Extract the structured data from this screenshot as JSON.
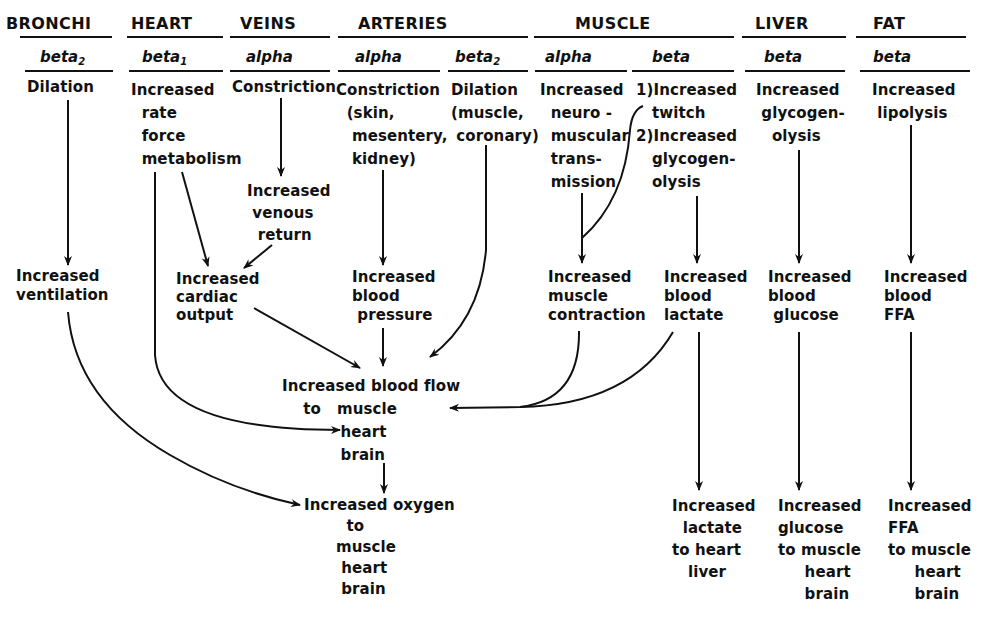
{
  "headers": [
    {
      "id": "bronchi",
      "label": "BRONCHI"
    },
    {
      "id": "heart",
      "label": "HEART"
    },
    {
      "id": "veins",
      "label": "VEINS"
    },
    {
      "id": "arteries",
      "label": "ARTERIES"
    },
    {
      "id": "muscle",
      "label": "MUSCLE"
    },
    {
      "id": "liver",
      "label": "LIVER"
    },
    {
      "id": "fat",
      "label": "FAT"
    }
  ],
  "receptors": [
    {
      "col": "bronchi",
      "label": "beta",
      "sub": "2"
    },
    {
      "col": "heart",
      "label": "beta",
      "sub": "1"
    },
    {
      "col": "veins",
      "label": "alpha",
      "sub": ""
    },
    {
      "col": "arteries-alpha",
      "label": "alpha",
      "sub": ""
    },
    {
      "col": "arteries-beta",
      "label": "beta",
      "sub": "2"
    },
    {
      "col": "muscle-alpha",
      "label": "alpha",
      "sub": ""
    },
    {
      "col": "muscle-beta",
      "label": "beta",
      "sub": ""
    },
    {
      "col": "liver",
      "label": "beta",
      "sub": ""
    },
    {
      "col": "fat",
      "label": "beta",
      "sub": ""
    }
  ],
  "effects": {
    "bronchi": "Dilation",
    "heart": "Increased\n  rate\n  force\n  metabolism",
    "veins": "Constriction",
    "arteries_alpha": "Constriction\n  (skin,\n   mesentery,\n   kidney)",
    "arteries_beta": "Dilation\n(muscle,\n coronary)",
    "muscle_alpha": "Increased\n  neuro -\n  muscular\n  trans-\n  mission",
    "muscle_beta": "1)Increased\n   twitch\n2)Increased\n   glycogen-\n   olysis",
    "liver": "Increased\n glycogen-\n   olysis",
    "fat": "Increased\n lipolysis"
  },
  "intermediate": {
    "venous_return": "Increased\n venous\n  return",
    "ventilation": "Increased\nventilation",
    "cardiac_output": "Increased\ncardiac\noutput",
    "blood_pressure": "Increased\nblood\n pressure",
    "muscle_contraction": "Increased\nmuscle\ncontraction",
    "blood_lactate": "Increased\nblood\nlactate",
    "blood_glucose": "Increased\nblood\n glucose",
    "blood_ffa": "Increased\nblood\nFFA"
  },
  "outcomes": {
    "blood_flow": "Increased blood flow\n    to   muscle\n           heart\n           brain",
    "oxygen": "Increased oxygen\n        to\n      muscle\n       heart\n       brain",
    "lactate": "Increased\n  lactate\nto heart\n   liver",
    "glucose": "Increased\nglucose\nto muscle\n     heart\n     brain",
    "ffa": "Increased\nFFA\nto muscle\n     heart\n     brain"
  }
}
